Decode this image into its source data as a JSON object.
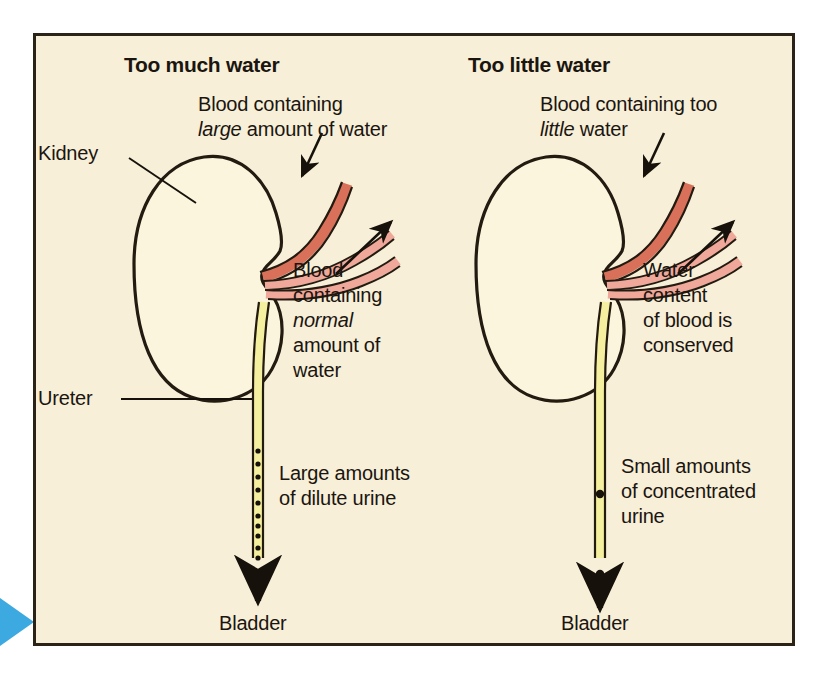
{
  "figure": {
    "background_color": "#F7EFD8",
    "border_color": "#2b2318",
    "marker_color": "#3CA9E0",
    "colors": {
      "kidney": "#FAF5DC",
      "artery_in": "#D9705A",
      "vein_out": "#F0A89A",
      "ureter": "#F5F0A0",
      "outline": "#231a10",
      "text": "#1b1510"
    }
  },
  "panels": {
    "left": {
      "heading": "Too much water",
      "blood_in_line1": "Blood containing",
      "blood_in_line2_pre": "",
      "blood_in_line2_em": "large",
      "blood_in_line2_post": " amount of water",
      "kidney_label": "Kidney",
      "ureter_label": "Ureter",
      "blood_out_line1": "Blood",
      "blood_out_line2": "containing",
      "blood_out_line3_em": "normal",
      "blood_out_line4": "amount of",
      "blood_out_line5": "water",
      "urine_line1": "Large amounts",
      "urine_line2": "of dilute urine",
      "bladder_label": "Bladder",
      "urine_dot_count": 10,
      "urine_dot_radius": 2.6
    },
    "right": {
      "heading": "Too little water",
      "blood_in_line1": "Blood containing too",
      "blood_in_line2_em": "little",
      "blood_in_line2_post": " water",
      "blood_out_line1": "Water",
      "blood_out_line2": "content",
      "blood_out_line3": "of blood is",
      "blood_out_line4": "conserved",
      "urine_line1": "Small amounts",
      "urine_line2": "of concentrated",
      "urine_line3": "urine",
      "bladder_label": "Bladder",
      "urine_dot_count": 2,
      "urine_dot_radius": 4.2
    }
  }
}
